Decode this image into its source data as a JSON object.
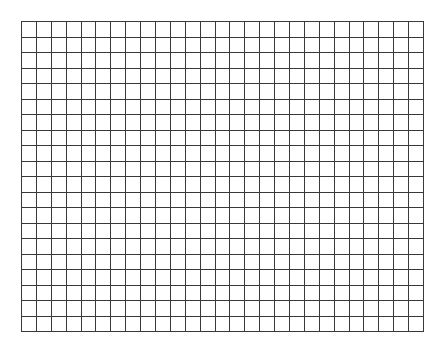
{
  "grid": {
    "columns": 27,
    "rows": 20,
    "left": 21,
    "top": 21,
    "width": 402,
    "height": 310,
    "line_color": "#3a3a3a",
    "background": "#ffffff"
  }
}
